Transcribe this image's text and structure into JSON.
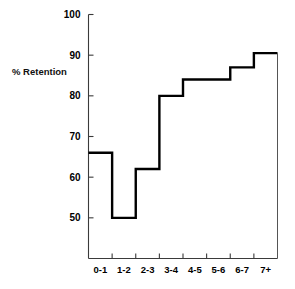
{
  "chart_data": {
    "type": "line",
    "subtype": "step",
    "title": "",
    "xlabel": "",
    "ylabel": "% Retention",
    "categories": [
      "0-1",
      "1-2",
      "2-3",
      "3-4",
      "4-5",
      "5-6",
      "6-7",
      "7+"
    ],
    "values": [
      66,
      50,
      62,
      80,
      84,
      84,
      87,
      90.5
    ],
    "ylim": [
      40,
      100
    ],
    "yticks": [
      50,
      60,
      70,
      80,
      90,
      100
    ],
    "ytick_labels": [
      "50",
      "60",
      "70",
      "80",
      "90",
      "100"
    ],
    "grid": false,
    "legend": false,
    "series": [
      {
        "name": "% Retention",
        "values": [
          66,
          50,
          62,
          80,
          84,
          84,
          87,
          90.5
        ],
        "color": "#000000"
      }
    ],
    "axis_color": "#3a3a3a",
    "line_color": "#000000",
    "background": "#ffffff"
  },
  "labels": {
    "y_axis_title": "% Retention",
    "y_ticks": [
      "100",
      "90",
      "80",
      "70",
      "60",
      "50"
    ],
    "x_ticks": [
      "0-1",
      "1-2",
      "2-3",
      "3-4",
      "4-5",
      "5-6",
      "6-7",
      "7+"
    ]
  }
}
